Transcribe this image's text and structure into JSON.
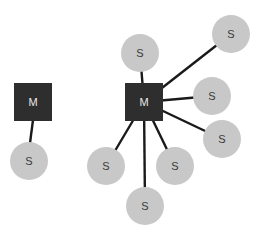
{
  "diagram": {
    "colors": {
      "master_fill": "#2e2e2e",
      "master_text": "#e8e8e8",
      "slave_fill": "#c8c8c8",
      "slave_text": "#3a3a3a",
      "edge": "#1a1a1a",
      "background": "#ffffff"
    },
    "groups": [
      {
        "name": "single-slave",
        "master": {
          "label": "M",
          "cx": 33,
          "cy": 102,
          "size": 38
        },
        "slaves": [
          {
            "label": "S",
            "cx": 29,
            "cy": 161,
            "r": 19
          }
        ]
      },
      {
        "name": "multi-slave",
        "master": {
          "label": "M",
          "cx": 144,
          "cy": 102,
          "size": 38
        },
        "slaves": [
          {
            "label": "S",
            "cx": 140,
            "cy": 53,
            "r": 19
          },
          {
            "label": "S",
            "cx": 231,
            "cy": 34,
            "r": 19
          },
          {
            "label": "S",
            "cx": 212,
            "cy": 96,
            "r": 19
          },
          {
            "label": "S",
            "cx": 222,
            "cy": 139,
            "r": 19
          },
          {
            "label": "S",
            "cx": 175,
            "cy": 166,
            "r": 19
          },
          {
            "label": "S",
            "cx": 145,
            "cy": 206,
            "r": 19
          },
          {
            "label": "S",
            "cx": 106,
            "cy": 166,
            "r": 19
          }
        ]
      }
    ]
  }
}
